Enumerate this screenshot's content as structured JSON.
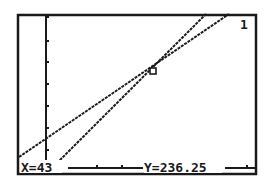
{
  "calculator": {
    "graph_number": "1",
    "trace": {
      "x_label": "X=43",
      "y_label": "Y=236.25",
      "x_value": 43,
      "y_value": 236.25
    }
  },
  "colors": {
    "lcd_background": "#ffffff",
    "pixel": "#1a1a1a"
  },
  "graph": {
    "functions": [
      {
        "name": "Y1",
        "description": "shallower line",
        "from": [
          19,
          157
        ],
        "to": [
          229,
          14
        ]
      },
      {
        "name": "Y2",
        "description": "steeper line",
        "from": [
          57,
          163
        ],
        "to": [
          206,
          14
        ]
      }
    ],
    "cursor": {
      "shape": "square",
      "x": 153,
      "y": 71
    },
    "y_axis_x": 46
  }
}
